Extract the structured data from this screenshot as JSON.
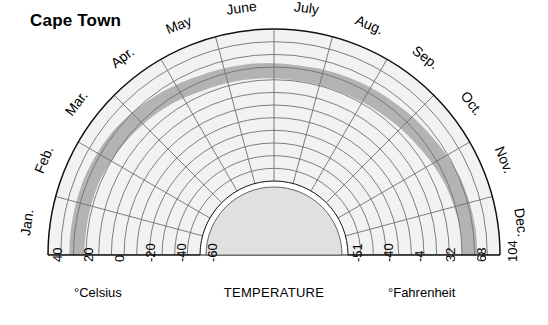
{
  "title": "Cape Town",
  "axis": {
    "center_label": "TEMPERATURE",
    "celsius_label": "°Celsius",
    "fahrenheit_label": "°Fahrenheit"
  },
  "chart_data": {
    "type": "area",
    "title": "Cape Town",
    "subtitle": "",
    "xlabel": "TEMPERATURE",
    "ylabel": "",
    "legend_position": "none",
    "grid": true,
    "projection": "polar-semicircle",
    "angular_categories": [
      "Jan.",
      "Feb.",
      "Mar.",
      "Apr.",
      "May",
      "June",
      "July",
      "Aug.",
      "Sep.",
      "Oct.",
      "Nov.",
      "Dec."
    ],
    "radial_axis": {
      "units_left": "°Celsius",
      "units_right": "°Fahrenheit",
      "celsius_ticks": [
        40,
        20,
        0,
        -20,
        -40,
        -60
      ],
      "fahrenheit_ticks": [
        -51,
        -40,
        -4,
        32,
        68,
        104
      ],
      "celsius_tick_labels": [
        "40",
        "20",
        "0",
        "-20",
        "-40",
        "-60"
      ],
      "fahrenheit_tick_labels": [
        "-51",
        "-40",
        "-4",
        "32",
        "68",
        "104"
      ],
      "outer_value_celsius": 40,
      "inner_value_celsius": -60,
      "ring_count": 12
    },
    "series": [
      {
        "name": "Monthly temperature band (outer edge, °C)",
        "categories": [
          "Jan.",
          "Feb.",
          "Mar.",
          "Apr.",
          "May",
          "June",
          "July",
          "Aug.",
          "Sep.",
          "Oct.",
          "Nov.",
          "Dec."
        ],
        "values": [
          26,
          26,
          25,
          22,
          19,
          18,
          17,
          18,
          19,
          21,
          24,
          25
        ]
      },
      {
        "name": "Monthly temperature band (inner edge, °C)",
        "categories": [
          "Jan.",
          "Feb.",
          "Mar.",
          "Apr.",
          "May",
          "June",
          "July",
          "Aug.",
          "Sep.",
          "Oct.",
          "Nov.",
          "Dec."
        ],
        "values": [
          16,
          16,
          14,
          12,
          9,
          8,
          7,
          7,
          8,
          10,
          13,
          15
        ]
      }
    ],
    "colors": {
      "band_fill": "#b3b3b3",
      "plate_fill": "#f2f2f2",
      "hub_fill": "#e0e0e0",
      "grid_line": "#6e6e6e",
      "outline": "#111111"
    }
  },
  "months": [
    {
      "label": "Jan.",
      "angle": 187.5
    },
    {
      "label": "Feb.",
      "angle": 202.5
    },
    {
      "label": "Mar.",
      "angle": 217.5
    },
    {
      "label": "Apr.",
      "angle": 232.5
    },
    {
      "label": "May",
      "angle": 247.5
    },
    {
      "label": "June",
      "angle": 262.5
    },
    {
      "label": "July",
      "angle": 277.5
    },
    {
      "label": "Aug.",
      "angle": 292.5
    },
    {
      "label": "Sep.",
      "angle": 307.5
    },
    {
      "label": "Oct.",
      "angle": 322.5
    },
    {
      "label": "Nov.",
      "angle": 337.5
    },
    {
      "label": "Dec.",
      "angle": 352.5
    }
  ],
  "celsius_ticks": [
    {
      "label": "40",
      "x": 44
    },
    {
      "label": "20",
      "x": 75
    },
    {
      "label": "0",
      "x": 106
    },
    {
      "label": "-20",
      "x": 137
    },
    {
      "label": "-40",
      "x": 168
    },
    {
      "label": "-60",
      "x": 199
    }
  ],
  "fahrenheit_ticks": [
    {
      "label": "-51",
      "x": 344
    },
    {
      "label": "-40",
      "x": 375
    },
    {
      "label": "-4",
      "x": 406
    },
    {
      "label": "32",
      "x": 437
    },
    {
      "label": "68",
      "x": 468
    },
    {
      "label": "104",
      "x": 499
    }
  ],
  "colors": {
    "band_fill": "#b3b3b3",
    "plate_fill": "#f2f2f2",
    "hub_fill": "#e0e0e0",
    "grid_line": "#707070",
    "outline": "#111111",
    "text": "#000000"
  }
}
